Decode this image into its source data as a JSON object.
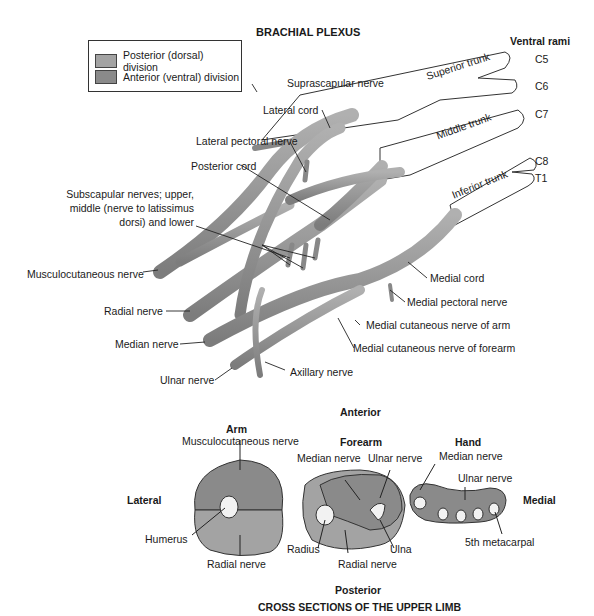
{
  "title": "BRACHIAL PLEXUS",
  "legend": {
    "items": [
      {
        "label": "Posterior (dorsal) division",
        "color": "#a3a3a3"
      },
      {
        "label": "Anterior (ventral) division",
        "color": "#8a8a8a"
      }
    ]
  },
  "ventral_rami": {
    "heading": "Ventral rami",
    "roots": [
      "C5",
      "C6",
      "C7",
      "C8",
      "T1"
    ]
  },
  "trunks": [
    "Superior trunk",
    "Middle trunk",
    "Inferior trunk"
  ],
  "plexus_labels": {
    "suprascapular": "Suprascapular nerve",
    "lateral_cord": "Lateral cord",
    "lateral_pectoral": "Lateral pectoral nerve",
    "posterior_cord": "Posterior cord",
    "subscapular_1": "Subscapular nerves; upper,",
    "subscapular_2": "middle (nerve to latissimus",
    "subscapular_3": "dorsi) and lower",
    "musculocutaneous": "Musculocutaneous nerve",
    "radial": "Radial nerve",
    "median": "Median nerve",
    "ulnar": "Ulnar nerve",
    "axillary": "Axillary nerve",
    "medial_cord": "Medial cord",
    "medial_pectoral": "Medial pectoral nerve",
    "medial_cut_arm": "Medial cutaneous nerve of arm",
    "medial_cut_forearm": "Medial cutaneous nerve of forearm"
  },
  "cross_sections": {
    "anterior": "Anterior",
    "posterior": "Posterior",
    "lateral": "Lateral",
    "medial": "Medial",
    "title": "CROSS SECTIONS OF THE UPPER LIMB",
    "arm": {
      "heading": "Arm",
      "musculocutaneous": "Musculocutaneous nerve",
      "humerus": "Humerus",
      "radial": "Radial nerve"
    },
    "forearm": {
      "heading": "Forearm",
      "median": "Median nerve",
      "ulnar": "Ulnar nerve",
      "radius": "Radius",
      "ulna": "Ulna",
      "radial": "Radial nerve"
    },
    "hand": {
      "heading": "Hand",
      "median": "Median nerve",
      "ulnar": "Ulnar nerve",
      "metacarpal": "5th metacarpal"
    }
  },
  "colors": {
    "posterior": "#a3a3a3",
    "anterior": "#8a8a8a",
    "nerve_outline": "#555555",
    "root_fill": "#ffffff"
  }
}
